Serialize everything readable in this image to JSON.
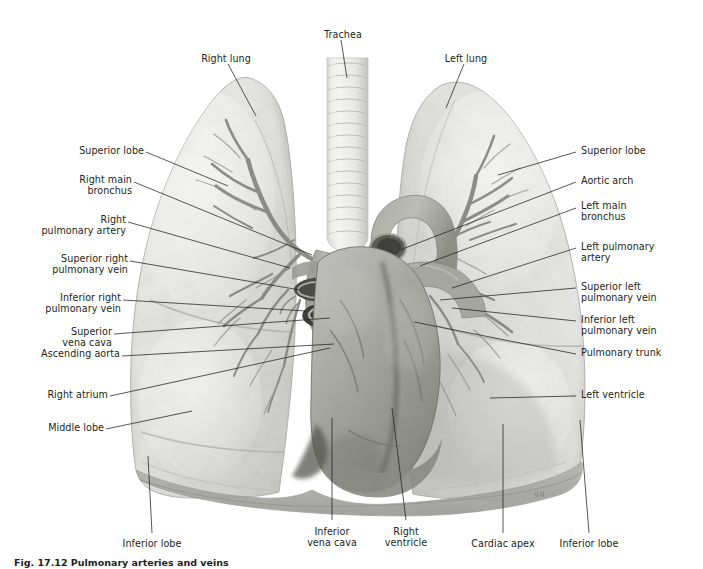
{
  "figure": {
    "caption": "Fig. 17.12 Pulmonary arteries and veins",
    "artist_signature": "V.d.",
    "colors": {
      "background": "#ffffff",
      "label_text": "#231f20",
      "leader_line": "#231f20",
      "lung_light": "#e9e9e7",
      "lung_mid": "#d2d3d1",
      "lung_shadow": "#b9bab7",
      "heart_light": "#b2b3b0",
      "heart_mid": "#95968f",
      "heart_dark": "#6f706a",
      "vessel_dark": "#5b5c57",
      "trachea_light": "#f0f0ee",
      "trachea_ring": "#cfd0cd",
      "bronchus_tree": "#8d8e88",
      "diaphragm": "#a9aaa6"
    }
  },
  "labels": {
    "top": [
      {
        "name": "trachea",
        "text": "Trachea",
        "x": 311,
        "y": 29,
        "w": 64,
        "align": "c"
      },
      {
        "name": "right-lung",
        "text": "Right lung",
        "x": 192,
        "y": 53,
        "w": 68,
        "align": "c"
      },
      {
        "name": "left-lung",
        "text": "Left lung",
        "x": 435,
        "y": 53,
        "w": 62,
        "align": "c"
      }
    ],
    "left": [
      {
        "name": "superior-lobe-right",
        "text": "Superior lobe",
        "y": 149
      },
      {
        "name": "right-main-bronchus",
        "text": "Right main\nbronchus",
        "y": 178
      },
      {
        "name": "right-pulmonary-artery",
        "text": "Right\npulmonary artery",
        "y": 218
      },
      {
        "name": "superior-right-pulmonary-vein",
        "text": "Superior right\npulmonary vein",
        "y": 257
      },
      {
        "name": "inferior-right-pulmonary-vein",
        "text": "Inferior right\npulmonary vein",
        "y": 296
      },
      {
        "name": "superior-vena-cava",
        "text": "Superior\nvena cava",
        "y": 330
      },
      {
        "name": "ascending-aorta",
        "text": "Ascending aorta",
        "y": 352
      },
      {
        "name": "right-atrium",
        "text": "Right atrium",
        "y": 393
      },
      {
        "name": "middle-lobe",
        "text": "Middle lobe",
        "y": 426
      }
    ],
    "right": [
      {
        "name": "superior-lobe-left",
        "text": "Superior lobe",
        "y": 149
      },
      {
        "name": "aortic-arch",
        "text": "Aortic arch",
        "y": 179
      },
      {
        "name": "left-main-bronchus",
        "text": "Left main\nbronchus",
        "y": 204
      },
      {
        "name": "left-pulmonary-artery",
        "text": "Left pulmonary\nartery",
        "y": 245
      },
      {
        "name": "superior-left-pulmonary-vein",
        "text": "Superior left\npulmonary vein",
        "y": 285
      },
      {
        "name": "inferior-left-pulmonary-vein",
        "text": "Inferior left\npulmonary vein",
        "y": 318
      },
      {
        "name": "pulmonary-trunk",
        "text": "Pulmonary trunk",
        "y": 351
      },
      {
        "name": "left-ventricle",
        "text": "Left ventricle",
        "y": 393
      }
    ],
    "bottom": [
      {
        "name": "inferior-lobe-right",
        "text": "Inferior lobe",
        "x": 116,
        "y": 538,
        "w": 72,
        "align": "c"
      },
      {
        "name": "inferior-vena-cava",
        "text": "Inferior\nvena cava",
        "x": 300,
        "y": 526,
        "w": 64,
        "align": "c"
      },
      {
        "name": "right-ventricle",
        "text": "Right\nventricle",
        "x": 378,
        "y": 526,
        "w": 56,
        "align": "c"
      },
      {
        "name": "cardiac-apex",
        "text": "Cardiac apex",
        "x": 467,
        "y": 538,
        "w": 72,
        "align": "c"
      },
      {
        "name": "inferior-lobe-left",
        "text": "Inferior lobe",
        "x": 553,
        "y": 538,
        "w": 72,
        "align": "c"
      }
    ]
  }
}
